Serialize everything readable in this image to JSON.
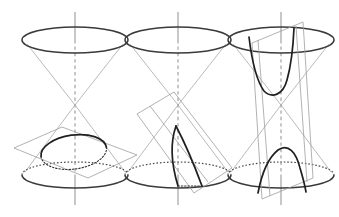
{
  "figure": {
    "background_color": "#ffffff",
    "width": 339,
    "height": 217,
    "colors": {
      "cone_outline": "#3a3a3a",
      "cone_side": "#a8a8a8",
      "axis": "#9a9a9a",
      "plane_edge": "#9e9e9e",
      "conic_curve": "#1f1f1f",
      "hidden_line": "#333333"
    },
    "panels": [
      {
        "id": "panel-ellipse",
        "conic_name": "ellipse",
        "description": "Plane cuts one nappe obliquely across all generators",
        "apex": {
          "x": 75,
          "y": 105
        },
        "axis": {
          "x": 75,
          "top_y": 12,
          "bottom_y": 205
        },
        "top_rim": {
          "cx": 75,
          "cy": 40,
          "rx": 53,
          "ry": 13
        },
        "bottom_rim": {
          "cx": 75,
          "cy": 175,
          "rx": 53,
          "ry": 13
        },
        "section_curve": {
          "cx": 74,
          "cy": 154,
          "rx": 33,
          "ry": 17,
          "rotation": -8
        },
        "cut_plane": {
          "points": "14,148 62,127 137,155 88,178",
          "tilt": "shallow"
        }
      },
      {
        "id": "panel-parabola",
        "conic_name": "parabola",
        "description": "Plane parallel to one generator cuts a single nappe",
        "apex": {
          "x": 178,
          "y": 105
        },
        "axis": {
          "x": 178,
          "top_y": 12,
          "bottom_y": 205
        },
        "top_rim": {
          "cx": 178,
          "cy": 40,
          "rx": 53,
          "ry": 13
        },
        "bottom_rim": {
          "cx": 178,
          "cy": 175,
          "rx": 53,
          "ry": 13
        },
        "cut_plane": {
          "points": "137,114 174,92 232,168 194,193",
          "tilt": "parallel-to-generator"
        }
      },
      {
        "id": "panel-hyperbola",
        "conic_name": "hyperbola",
        "description": "Near vertical plane cuts both nappes giving two branches",
        "apex": {
          "x": 281,
          "y": 105
        },
        "axis": {
          "x": 281,
          "top_y": 12,
          "bottom_y": 205
        },
        "top_rim": {
          "cx": 281,
          "cy": 40,
          "rx": 53,
          "ry": 13
        },
        "bottom_rim": {
          "cx": 281,
          "cy": 175,
          "rx": 53,
          "ry": 13
        },
        "cut_plane": {
          "points": "252,43 303,22 313,178 262,199",
          "tilt": "steep"
        }
      }
    ]
  }
}
